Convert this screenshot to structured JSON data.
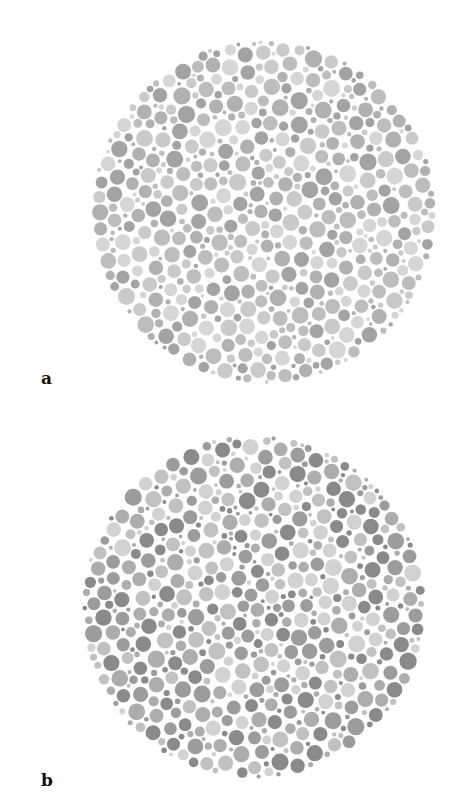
{
  "figure": {
    "plates": [
      {
        "id": "a",
        "label": "a",
        "center": [
          264,
          212
        ],
        "radius": 172,
        "seed": 1337,
        "dot_count": 1400,
        "tones": [
          "#d6d6d6",
          "#cacaca",
          "#bdbdbd",
          "#b1b1b1",
          "#a3a3a3"
        ],
        "label_pos": [
          41,
          370
        ]
      },
      {
        "id": "b",
        "label": "b",
        "center": [
          254,
          607
        ],
        "radius": 172,
        "seed": 4242,
        "dot_count": 1400,
        "tones": [
          "#d2d2d2",
          "#c1c1c1",
          "#adadad",
          "#9c9c9c",
          "#8a8a8a"
        ],
        "label_pos": [
          41,
          772
        ]
      }
    ]
  }
}
